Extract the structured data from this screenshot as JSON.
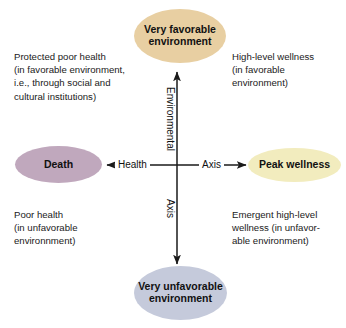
{
  "diagram": {
    "background_color": "#ffffff",
    "axes": {
      "horizontal": {
        "name": "Health Axis",
        "left_word": "Health",
        "right_word": "Axis",
        "left_end_label": "Death",
        "right_end_label": "Peak wellness",
        "stroke_color": "#1a1a1a"
      },
      "vertical": {
        "name": "Environmental Axis",
        "top_word": "Environmental",
        "bottom_word": "Axis",
        "top_end_label": "Very favorable environment",
        "bottom_end_label": "Very unfavorable environment",
        "stroke_color": "#1a1a1a"
      }
    },
    "nodes": [
      {
        "id": "very-favorable-environment",
        "position": "top",
        "label": "Very favorable\nenvironment",
        "fill_color": "#e8cfa2",
        "text_color": "#111111"
      },
      {
        "id": "peak-wellness",
        "position": "right",
        "label": "Peak wellness",
        "fill_color": "#f2ecbe",
        "text_color": "#111111"
      },
      {
        "id": "very-unfavorable-environment",
        "position": "bottom",
        "label": "Very unfavorable\nenvironment",
        "fill_color": "#c5cadb",
        "text_color": "#111111"
      },
      {
        "id": "death",
        "position": "left",
        "label": "Death",
        "fill_color": "#c0a8bd",
        "text_color": "#111111"
      }
    ],
    "quadrants": [
      {
        "id": "top-left",
        "text": "Protected poor health\n(in favorable environment,\ni.e., through social and\ncultural institutions)"
      },
      {
        "id": "top-right",
        "text": "High-level wellness\n(in favorable\nenvironment)"
      },
      {
        "id": "bottom-left",
        "text": "Poor health\n(in unfavorable\nenvironnment)"
      },
      {
        "id": "bottom-right",
        "text": "Emergent high-level\nwellness (in unfavor-\nable environment)"
      }
    ]
  }
}
